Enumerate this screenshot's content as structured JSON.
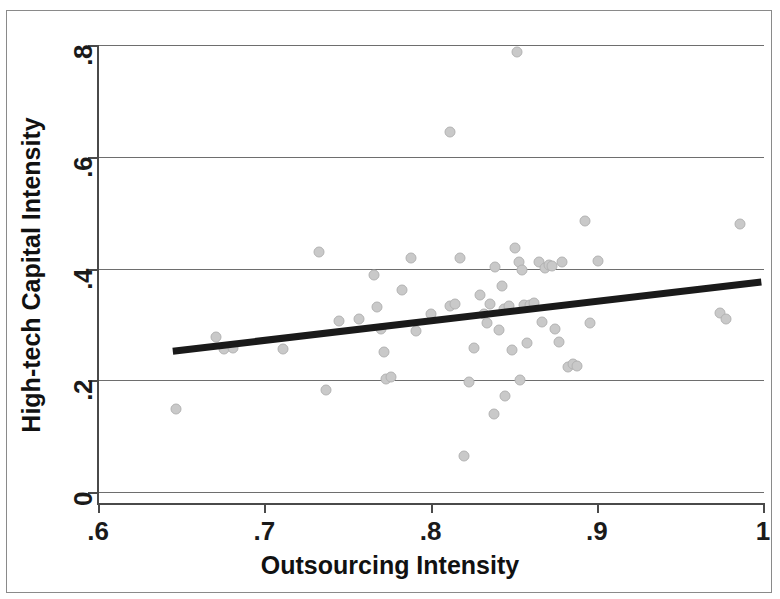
{
  "chart_data": {
    "type": "scatter",
    "title": "",
    "xlabel": "Outsourcing Intensity",
    "ylabel": "High-tech Capital Intensity",
    "xlim": [
      0.6,
      1.0
    ],
    "ylim": [
      0.0,
      0.8
    ],
    "xticks": [
      ".6",
      ".7",
      ".8",
      ".9",
      "1"
    ],
    "xtick_values": [
      0.6,
      0.7,
      0.8,
      0.9,
      1.0
    ],
    "yticks": [
      "0",
      ".2",
      ".4",
      ".6",
      ".8"
    ],
    "ytick_values": [
      0.0,
      0.2,
      0.4,
      0.6,
      0.8
    ],
    "grid": "horizontal",
    "legend": null,
    "marker_color": "#c9c9c9",
    "fitline_color": "#1a1a1a",
    "fit_line": {
      "x0": 0.645,
      "y0": 0.252,
      "x1": 0.999,
      "y1": 0.376
    },
    "points": [
      {
        "x": 0.647,
        "y": 0.148
      },
      {
        "x": 0.671,
        "y": 0.277
      },
      {
        "x": 0.676,
        "y": 0.256
      },
      {
        "x": 0.681,
        "y": 0.258
      },
      {
        "x": 0.711,
        "y": 0.256
      },
      {
        "x": 0.733,
        "y": 0.43
      },
      {
        "x": 0.737,
        "y": 0.182
      },
      {
        "x": 0.745,
        "y": 0.306
      },
      {
        "x": 0.757,
        "y": 0.309
      },
      {
        "x": 0.766,
        "y": 0.389
      },
      {
        "x": 0.768,
        "y": 0.331
      },
      {
        "x": 0.77,
        "y": 0.292
      },
      {
        "x": 0.772,
        "y": 0.251
      },
      {
        "x": 0.773,
        "y": 0.203
      },
      {
        "x": 0.776,
        "y": 0.205
      },
      {
        "x": 0.783,
        "y": 0.361
      },
      {
        "x": 0.788,
        "y": 0.419
      },
      {
        "x": 0.791,
        "y": 0.288
      },
      {
        "x": 0.8,
        "y": 0.318
      },
      {
        "x": 0.812,
        "y": 0.645
      },
      {
        "x": 0.812,
        "y": 0.333
      },
      {
        "x": 0.815,
        "y": 0.337
      },
      {
        "x": 0.818,
        "y": 0.418
      },
      {
        "x": 0.82,
        "y": 0.065
      },
      {
        "x": 0.823,
        "y": 0.196
      },
      {
        "x": 0.826,
        "y": 0.258
      },
      {
        "x": 0.83,
        "y": 0.352
      },
      {
        "x": 0.832,
        "y": 0.319
      },
      {
        "x": 0.834,
        "y": 0.303
      },
      {
        "x": 0.836,
        "y": 0.337
      },
      {
        "x": 0.838,
        "y": 0.14
      },
      {
        "x": 0.839,
        "y": 0.402
      },
      {
        "x": 0.841,
        "y": 0.29
      },
      {
        "x": 0.843,
        "y": 0.368
      },
      {
        "x": 0.844,
        "y": 0.328
      },
      {
        "x": 0.845,
        "y": 0.172
      },
      {
        "x": 0.847,
        "y": 0.332
      },
      {
        "x": 0.849,
        "y": 0.255
      },
      {
        "x": 0.851,
        "y": 0.436
      },
      {
        "x": 0.852,
        "y": 0.788
      },
      {
        "x": 0.853,
        "y": 0.412
      },
      {
        "x": 0.854,
        "y": 0.2
      },
      {
        "x": 0.855,
        "y": 0.398
      },
      {
        "x": 0.856,
        "y": 0.334
      },
      {
        "x": 0.858,
        "y": 0.266
      },
      {
        "x": 0.86,
        "y": 0.335
      },
      {
        "x": 0.862,
        "y": 0.338
      },
      {
        "x": 0.865,
        "y": 0.412
      },
      {
        "x": 0.867,
        "y": 0.305
      },
      {
        "x": 0.869,
        "y": 0.401
      },
      {
        "x": 0.871,
        "y": 0.407
      },
      {
        "x": 0.873,
        "y": 0.404
      },
      {
        "x": 0.875,
        "y": 0.292
      },
      {
        "x": 0.877,
        "y": 0.268
      },
      {
        "x": 0.879,
        "y": 0.411
      },
      {
        "x": 0.883,
        "y": 0.224
      },
      {
        "x": 0.886,
        "y": 0.229
      },
      {
        "x": 0.888,
        "y": 0.226
      },
      {
        "x": 0.893,
        "y": 0.485
      },
      {
        "x": 0.896,
        "y": 0.302
      },
      {
        "x": 0.901,
        "y": 0.413
      },
      {
        "x": 0.974,
        "y": 0.32
      },
      {
        "x": 0.978,
        "y": 0.31
      },
      {
        "x": 0.986,
        "y": 0.48
      }
    ]
  },
  "figure": {
    "frame_color": "#8a8a8a",
    "axis_color": "#4a4a4a",
    "grid_color": "#6e6e6e"
  }
}
